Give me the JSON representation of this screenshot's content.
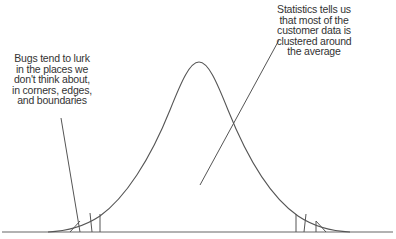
{
  "annotations": {
    "left_note": "Bugs tend to lurk\nin the places we\ndon't think about,\nin corners, edges,\nand boundaries",
    "right_note": "Statistics tells us\nthat most of the\ncustomer data is\nclustered around\nthe average"
  },
  "colors": {
    "line": "#555555",
    "text": "#333333",
    "background": "#ffffff"
  },
  "curve": {
    "type": "normal-distribution",
    "peak_x": 199,
    "peak_y": 62,
    "baseline_y": 232
  }
}
